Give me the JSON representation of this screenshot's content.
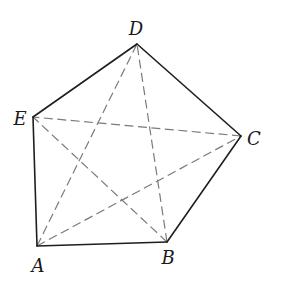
{
  "diagram": {
    "type": "pentagon-with-diagonals",
    "vertices": {
      "A": {
        "label": "A",
        "x": 37,
        "y": 246,
        "lx": 38,
        "ly": 265
      },
      "B": {
        "label": "B",
        "x": 167,
        "y": 242,
        "lx": 168,
        "ly": 257
      },
      "C": {
        "label": "C",
        "x": 241,
        "y": 136,
        "lx": 254,
        "ly": 138
      },
      "D": {
        "label": "D",
        "x": 137,
        "y": 44,
        "lx": 136,
        "ly": 28
      },
      "E": {
        "label": "E",
        "x": 33,
        "y": 117,
        "lx": 20,
        "ly": 118
      }
    },
    "edges": [
      [
        "A",
        "B"
      ],
      [
        "B",
        "C"
      ],
      [
        "C",
        "D"
      ],
      [
        "D",
        "E"
      ],
      [
        "E",
        "A"
      ]
    ],
    "diagonals": [
      [
        "A",
        "C"
      ],
      [
        "A",
        "D"
      ],
      [
        "B",
        "D"
      ],
      [
        "B",
        "E"
      ],
      [
        "C",
        "E"
      ]
    ],
    "colors": {
      "edge": "#1e1e1e",
      "diagonal": "#7a7a7a",
      "label": "#1a1a1a"
    }
  }
}
